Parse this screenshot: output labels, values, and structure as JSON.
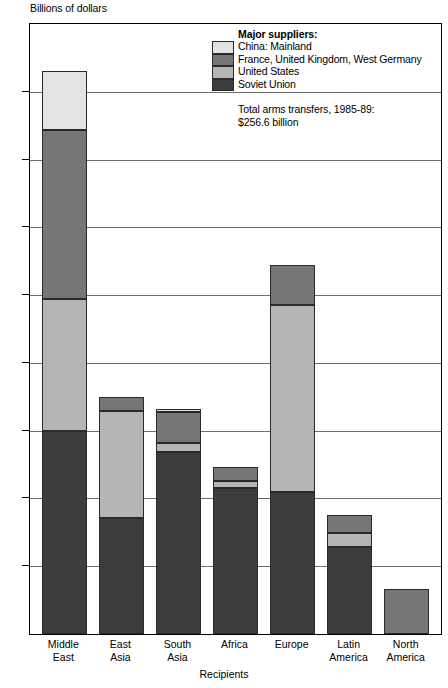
{
  "chart_data": {
    "type": "bar",
    "subtype": "stacked-vertical",
    "title": "",
    "ylabel": "Billions of dollars",
    "xlabel": "Recipients",
    "ylim": [
      0,
      72
    ],
    "yticks": [
      0,
      8,
      16,
      24,
      32,
      40,
      48,
      56,
      64,
      72
    ],
    "grid": true,
    "legend_position": "top-right",
    "legend_title": "Major suppliers:",
    "categories": [
      "Middle East",
      "East Asia",
      "South Asia",
      "Africa",
      "Europe",
      "Latin America",
      "North America"
    ],
    "category_lines": [
      [
        "Middle",
        "East"
      ],
      [
        "East",
        "Asia"
      ],
      [
        "South",
        "Asia"
      ],
      [
        "Africa",
        ""
      ],
      [
        "Europe",
        ""
      ],
      [
        "Latin",
        "America"
      ],
      [
        "North",
        "America"
      ]
    ],
    "series": [
      {
        "name": "Soviet Union",
        "color": "#3d3d3d",
        "values": [
          24.0,
          13.7,
          21.5,
          17.2,
          16.8,
          10.3,
          0.0
        ]
      },
      {
        "name": "United States",
        "color": "#b5b5b5",
        "values": [
          15.5,
          12.6,
          1.0,
          0.9,
          22.0,
          1.6,
          0.0
        ]
      },
      {
        "name": "France, United Kingdom, West Germany",
        "color": "#767676",
        "values": [
          20.0,
          1.7,
          3.7,
          1.6,
          4.7,
          2.1,
          5.3
        ]
      },
      {
        "name": "China: Mainland",
        "color": "#e3e3e3",
        "values": [
          7.0,
          0.0,
          0.4,
          0.0,
          0.0,
          0.0,
          0.0
        ]
      }
    ],
    "totals": [
      66.5,
      28.0,
      26.6,
      19.7,
      43.5,
      14.0,
      5.3
    ],
    "annotations": [
      "Total arms transfers, 1985-89:",
      "$256.6 billion"
    ]
  },
  "legend": {
    "title": "Major suppliers:",
    "entries": [
      {
        "label": "China: Mainland",
        "color": "#e3e3e3"
      },
      {
        "label": "France, United Kingdom, West Germany",
        "color": "#767676"
      },
      {
        "label": "United States",
        "color": "#b5b5b5"
      },
      {
        "label": "Soviet Union",
        "color": "#3d3d3d"
      }
    ],
    "total_line_1": "Total arms transfers, 1985-89:",
    "total_line_2": "$256.6 billion"
  },
  "axes": {
    "y_title": "Billions of dollars",
    "x_title": "Recipients",
    "y_tick_labels": [
      "0",
      "8",
      "16",
      "24",
      "32",
      "40",
      "48",
      "56",
      "64",
      "72"
    ]
  }
}
